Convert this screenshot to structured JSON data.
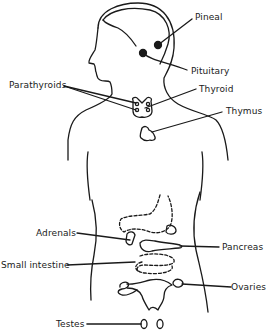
{
  "diagram": {
    "title": "",
    "labels": {
      "pineal": "Pineal",
      "pituitary": "Pituitary",
      "parathyroids": "Parathyroids",
      "thyroid": "Thyroid",
      "thymus": "Thymus",
      "adrenals": "Adrenals",
      "pancreas": "Pancreas",
      "small_intestine": "Small intestine",
      "ovaries": "Ovaries",
      "testes": "Testes"
    },
    "colors": {
      "line": "#1a1a1a",
      "background": "#ffffff"
    }
  }
}
